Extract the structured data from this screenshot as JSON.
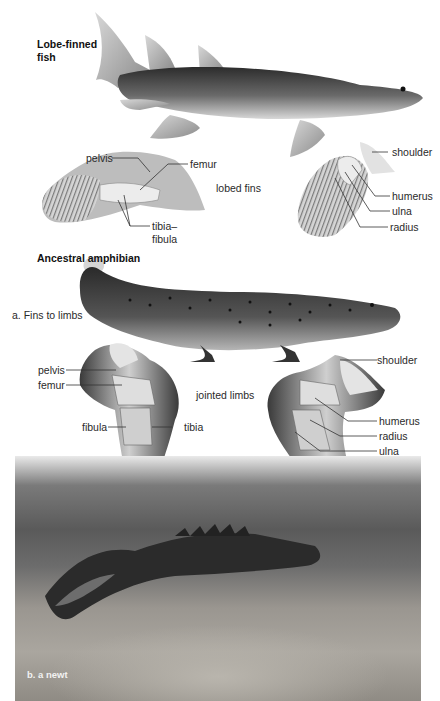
{
  "figure": {
    "panel_a": {
      "caption": "a. Fins to limbs",
      "fish": {
        "title_line1": "Lobe-finned",
        "title_line2": "fish",
        "center_label": "lobed fins",
        "pelvic_fin_labels": [
          "pelvis",
          "femur",
          "tibia–",
          "fibula"
        ],
        "pectoral_fin_labels": [
          "shoulder",
          "humerus",
          "ulna",
          "radius"
        ]
      },
      "amphibian": {
        "title": "Ancestral amphibian",
        "center_label": "jointed limbs",
        "hind_limb_labels": [
          "pelvis",
          "femur",
          "fibula",
          "tibia"
        ],
        "fore_limb_labels": [
          "shoulder",
          "humerus",
          "radius",
          "ulna"
        ]
      }
    },
    "panel_b": {
      "caption": "b. a newt"
    }
  }
}
